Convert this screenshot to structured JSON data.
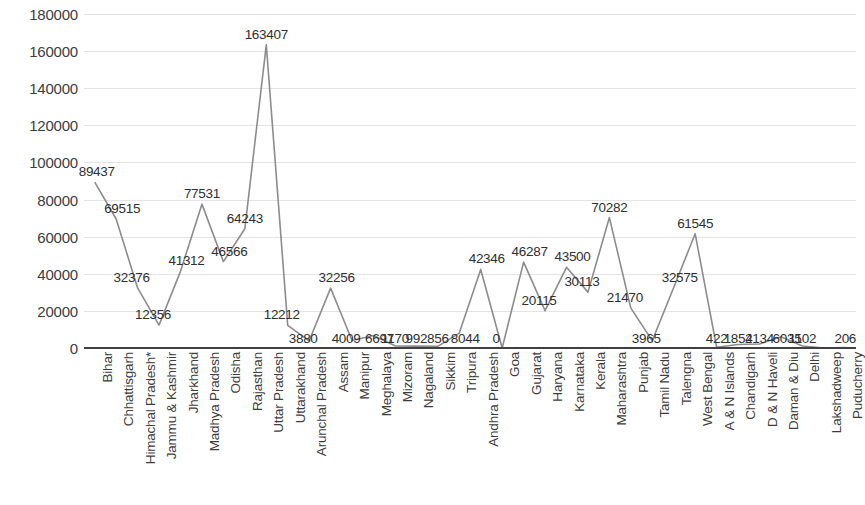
{
  "chart_data": {
    "type": "line",
    "title": "",
    "xlabel": "",
    "ylabel": "",
    "ylim": [
      0,
      180000
    ],
    "grid": true,
    "legend": "none",
    "y_ticks": [
      0,
      20000,
      40000,
      60000,
      80000,
      100000,
      120000,
      140000,
      160000,
      180000
    ],
    "y_tick_labels": [
      "0",
      "20000",
      "40000",
      "60000",
      "80000",
      "100000",
      "120000",
      "140000",
      "160000",
      "180000"
    ],
    "line_color": "#8c8c8c",
    "axis_color": "#404040",
    "gridline_color": "#e4e4e4",
    "categories": [
      "Bihar",
      "Chhattisgarh",
      "Himachal Pradesh*",
      "Jammu & Kashmir",
      "Jharkhand",
      "Madhya Pradesh",
      "Odisha",
      "Rajasthan",
      "Uttar Pradesh",
      "Uttarakhand",
      "Arunchal Pradesh",
      "Assam",
      "Manipur",
      "Meghalaya",
      "Mizoram",
      "Nagaland",
      "Sikkim",
      "Tripura",
      "Andhra Pradesh",
      "Goa",
      "Gujarat",
      "Haryana",
      "Karnataka",
      "Kerala",
      "Maharashtra",
      "Punjab",
      "Tamil Nadu",
      "Talengna",
      "West Bengal",
      "A & N Islands",
      "Chandigarh",
      "D & N Haveli",
      "Daman & Diu",
      "Delhi",
      "Lakshadweep",
      "Puducherry"
    ],
    "values": [
      89437,
      69515,
      32376,
      12356,
      41312,
      77531,
      46566,
      64243,
      163407,
      12212,
      3880,
      32256,
      4009,
      6697,
      1170,
      992,
      856,
      8044,
      42346,
      0,
      46287,
      20115,
      43500,
      30113,
      70282,
      21470,
      3965,
      32575,
      61545,
      422,
      1854,
      2134,
      6035,
      1102,
      0,
      206
    ],
    "data_labels": [
      "89437",
      "69515",
      "32376",
      "12356",
      "41312",
      "77531",
      "46566",
      "64243",
      "163407",
      "12212",
      "3880",
      "32256",
      "4009",
      "6697",
      "1170",
      "992",
      "856",
      "8044",
      "42346",
      "0",
      "46287",
      "20115",
      "43500",
      "30113",
      "70282",
      "21470",
      "3965",
      "32575",
      "61545",
      "422",
      "1854",
      "2134",
      "6035",
      "1102",
      "",
      "206"
    ]
  }
}
